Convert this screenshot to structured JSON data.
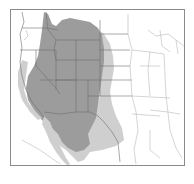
{
  "map": {
    "subject": "Range map over western and central United States and northern Mexico",
    "colors": {
      "background": "#ffffff",
      "frame": "#8a8a8a",
      "borders": "#6e6e6e",
      "borders_light": "#b8b8b8",
      "primary_range": "#9c9c9c",
      "secondary_range": "#cfcfcf"
    },
    "legend": []
  }
}
